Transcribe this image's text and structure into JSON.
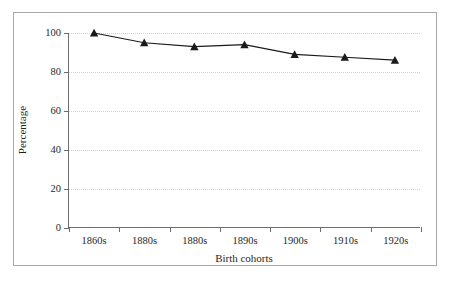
{
  "figure": {
    "background_color": "#ffffff",
    "frame_color": "#a8a8a8",
    "axis_color": "#6d6d6d",
    "grid_color": "#d2d2d2",
    "series_color": "#1a1a1a"
  },
  "chart_data": {
    "type": "line",
    "title": "",
    "subtitle": "",
    "xlabel": "Birth cohorts",
    "ylabel": "Percentage",
    "categories": [
      "1860s",
      "1880s",
      "1880s",
      "1890s",
      "1900s",
      "1910s",
      "1920s"
    ],
    "values": [
      100,
      95,
      93,
      94,
      89,
      87.5,
      86
    ],
    "series": [
      {
        "name": "Percentage",
        "values": [
          100,
          95,
          93,
          94,
          89,
          87.5,
          86
        ],
        "marker": "triangle",
        "marker_color": "#1a1a1a",
        "line_color": "#1a1a1a"
      }
    ],
    "ylim": [
      0,
      100
    ],
    "yticks": [
      0,
      20,
      40,
      60,
      80,
      100
    ],
    "ytick_labels": [
      "0",
      "20",
      "40",
      "60",
      "80",
      "100"
    ],
    "grid": "horizontal-dotted",
    "legend": "none",
    "annotations": []
  }
}
